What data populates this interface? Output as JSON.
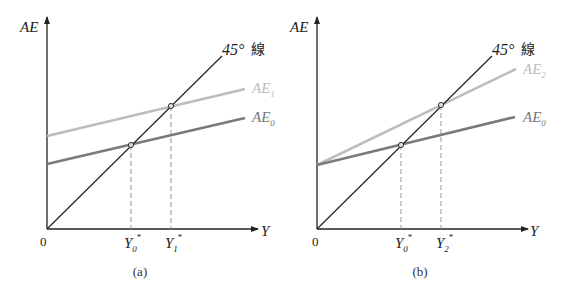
{
  "colors": {
    "axis": "#222222",
    "line45": "#222222",
    "ae_base": "#7a7a7a",
    "ae_shift": "#bdbdbd",
    "guide": "#999999"
  },
  "panels": [
    {
      "id": "a",
      "caption": "(a)",
      "y_axis_label": "AE",
      "x_axis_label": "Y",
      "origin_label": "0",
      "line45_label": "45°",
      "line45_suffix": "線",
      "base_line": {
        "label": "AE",
        "sub": "0"
      },
      "shift_line": {
        "label": "AE",
        "sub": "1"
      },
      "ticks": [
        {
          "label": "Y",
          "sub": "0",
          "sup": "*"
        },
        {
          "label": "Y",
          "sub": "1",
          "sup": "*"
        }
      ]
    },
    {
      "id": "b",
      "caption": "(b)",
      "y_axis_label": "AE",
      "x_axis_label": "Y",
      "origin_label": "0",
      "line45_label": "45°",
      "line45_suffix": "線",
      "base_line": {
        "label": "AE",
        "sub": "0"
      },
      "shift_line": {
        "label": "AE",
        "sub": "2"
      },
      "ticks": [
        {
          "label": "Y",
          "sub": "0",
          "sup": "*"
        },
        {
          "label": "Y",
          "sub": "2",
          "sup": "*"
        }
      ]
    }
  ]
}
